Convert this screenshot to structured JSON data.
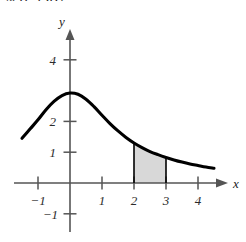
{
  "answer": {
    "text": "≈ 0.9367"
  },
  "chart_data": {
    "type": "area",
    "title": "",
    "xlabel": "x",
    "ylabel": "y",
    "xlim": [
      -1.7,
      4.8
    ],
    "ylim": [
      -1.6,
      4.6
    ],
    "grid": false,
    "legend": null,
    "x_ticks": [
      -1,
      1,
      2,
      3,
      4
    ],
    "x_tick_labels": [
      "−1",
      "1",
      "2",
      "3",
      "4"
    ],
    "y_ticks": [
      -1,
      1,
      2,
      4
    ],
    "y_tick_labels": [
      "−1",
      "1",
      "2",
      "4"
    ],
    "curve": {
      "name": "bell-shaped decaying curve",
      "points": [
        [
          -1.5,
          1.45
        ],
        [
          -1.25,
          1.75
        ],
        [
          -1.0,
          2.05
        ],
        [
          -0.75,
          2.38
        ],
        [
          -0.5,
          2.65
        ],
        [
          -0.25,
          2.84
        ],
        [
          0.0,
          2.92
        ],
        [
          0.25,
          2.88
        ],
        [
          0.5,
          2.72
        ],
        [
          0.75,
          2.48
        ],
        [
          1.0,
          2.2
        ],
        [
          1.25,
          1.93
        ],
        [
          1.5,
          1.69
        ],
        [
          1.75,
          1.48
        ],
        [
          2.0,
          1.3
        ],
        [
          2.25,
          1.15
        ],
        [
          2.5,
          1.02
        ],
        [
          2.75,
          0.92
        ],
        [
          3.0,
          0.83
        ],
        [
          3.25,
          0.75
        ],
        [
          3.5,
          0.68
        ],
        [
          3.75,
          0.62
        ],
        [
          4.0,
          0.57
        ],
        [
          4.25,
          0.52
        ],
        [
          4.5,
          0.48
        ]
      ]
    },
    "shaded_region": {
      "label": "shaded area under curve",
      "x_from": 2,
      "x_to": 3,
      "fill_color": "#d8d8d8",
      "edge_color": "#000000"
    },
    "colors": {
      "curve": "#000000",
      "axis": "#555555",
      "shade": "#d8d8d8"
    }
  }
}
